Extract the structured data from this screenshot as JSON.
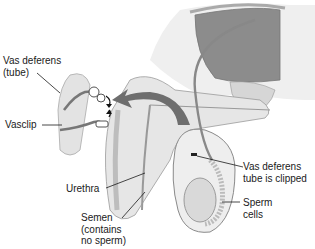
{
  "diagram": {
    "labels": {
      "vas_deferens": "Vas deferens\n(tube)",
      "vasclip": "Vasclip",
      "urethra": "Urethra",
      "semen": "Semen\n(contains\nno sperm)",
      "vas_clipped": "Vas deferens\ntube is clipped",
      "sperm_cells": "Sperm\ncells"
    },
    "colors": {
      "line": "#1a1a1a",
      "tissue_light": "#e6e6e6",
      "tissue_mid": "#bdbdbd",
      "bladder": "#8c8c8c",
      "arrow": "#6e6e6e",
      "outline": "#9a9a9a"
    }
  }
}
